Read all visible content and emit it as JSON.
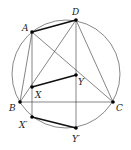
{
  "diagram": {
    "circle": {
      "cx": 66,
      "cy": 74,
      "r": 54
    },
    "points": {
      "A": {
        "x": 32,
        "y": 32,
        "label": "A",
        "lx": 22,
        "ly": 31
      },
      "D": {
        "x": 76,
        "y": 20,
        "label": "D",
        "lx": 72,
        "ly": 15
      },
      "Y": {
        "x": 76,
        "y": 75,
        "label": "Y",
        "lx": 78,
        "ly": 85
      },
      "X": {
        "x": 32,
        "y": 87,
        "label": "X",
        "lx": 35,
        "ly": 98
      },
      "B": {
        "x": 20,
        "y": 102,
        "label": "B",
        "lx": 9,
        "ly": 111
      },
      "C": {
        "x": 113,
        "y": 102,
        "label": "C",
        "lx": 116,
        "ly": 111
      },
      "Xp": {
        "x": 32,
        "y": 117,
        "label": "X′",
        "lx": 19,
        "ly": 128
      },
      "Yp": {
        "x": 76,
        "y": 128,
        "label": "Y′",
        "lx": 72,
        "ly": 142
      }
    },
    "thin_segments": [
      [
        "A",
        "B"
      ],
      [
        "A",
        "C"
      ],
      [
        "A",
        "Xp"
      ],
      [
        "D",
        "B"
      ],
      [
        "D",
        "C"
      ],
      [
        "D",
        "Yp"
      ],
      [
        "B",
        "C"
      ]
    ],
    "thick_segments": [
      [
        "A",
        "D"
      ],
      [
        "X",
        "Y"
      ],
      [
        "Xp",
        "Yp"
      ]
    ],
    "colors": {
      "stroke": "#333333",
      "thick": "#111111",
      "point": "#000000"
    }
  }
}
